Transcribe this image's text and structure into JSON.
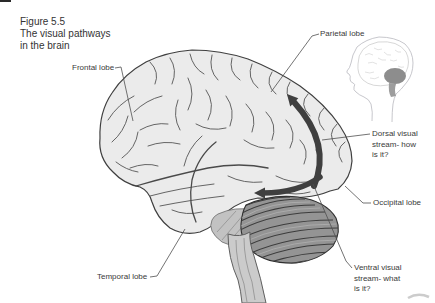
{
  "figure": {
    "title_lines": [
      "Figure 5.5",
      "The visual pathways",
      "in the brain"
    ]
  },
  "labels": {
    "frontal": "Frontal lobe",
    "parietal": "Parietal lobe",
    "temporal": "Temporal lobe",
    "occipital": "Occipital lobe",
    "dorsal_lines": [
      "Dorsal visual",
      "stream- how",
      "is it?"
    ],
    "ventral_lines": [
      "Ventral visual",
      "stream- what",
      "is it?"
    ]
  },
  "colors": {
    "background": "#ffffff",
    "brain_fill": "#ebebeb",
    "brain_outline": "#3f3f3f",
    "sulci": "#555555",
    "cerebellum_fill": "#949494",
    "cerebellum_stripe": "#3c3c3c",
    "brainstem_fill": "#cbcbcb",
    "arrow": "#3f3f3f",
    "leader_line": "#4f4f4f",
    "text": "#3a3a3a",
    "inset_line": "#b9b9bf",
    "inset_dark_region": "#8d8d8d"
  }
}
